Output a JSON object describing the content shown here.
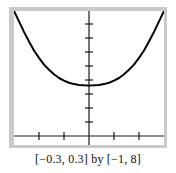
{
  "figure": {
    "caption": "[−0.3, 0.3] by [−1, 8]",
    "background_color": "#ffffff",
    "frame_color": "#c9c9c9",
    "plot_background": "#ffffff",
    "axis_color": "#1a1a1a",
    "curve_color": "#000000"
  },
  "chart_data": {
    "type": "line",
    "title": "",
    "subtitle": "",
    "xlabel": "",
    "ylabel": "",
    "caption": "[−0.3, 0.3] by [−1, 8]",
    "xlim": [
      -0.3,
      0.3
    ],
    "ylim": [
      -1,
      8
    ],
    "grid": false,
    "legend": null,
    "x_tick_values": [
      -0.2,
      -0.1,
      0.1,
      0.2
    ],
    "x_tick_labels": [
      "",
      "",
      "",
      ""
    ],
    "y_tick_values": [
      1,
      2,
      3,
      4,
      5,
      6,
      7,
      8
    ],
    "y_tick_labels": [
      "",
      "",
      "",
      "",
      "",
      "",
      "",
      ""
    ],
    "x_tick_step": 0.1,
    "y_tick_step": 1,
    "axes_drawn": [
      "x-axis at y=0",
      "y-axis at x=0"
    ],
    "series": [
      {
        "name": "curve",
        "description": "symmetric U-shaped curve with minimum at x=0",
        "minimum": {
          "x": 0,
          "y": 3.0
        },
        "x": [
          -0.3,
          -0.28,
          -0.26,
          -0.24,
          -0.22,
          -0.2,
          -0.18,
          -0.16,
          -0.14,
          -0.12,
          -0.1,
          -0.08,
          -0.06,
          -0.04,
          -0.02,
          0.0,
          0.02,
          0.04,
          0.06,
          0.08,
          0.1,
          0.12,
          0.14,
          0.16,
          0.18,
          0.2,
          0.22,
          0.24,
          0.26,
          0.28,
          0.3
        ],
        "y": [
          8.0,
          7.3,
          6.6,
          5.95,
          5.35,
          4.85,
          4.4,
          4.05,
          3.75,
          3.5,
          3.32,
          3.18,
          3.09,
          3.03,
          3.01,
          3.0,
          3.01,
          3.03,
          3.09,
          3.18,
          3.32,
          3.5,
          3.75,
          4.05,
          4.4,
          4.85,
          5.35,
          5.95,
          6.6,
          7.3,
          8.0
        ]
      }
    ]
  }
}
